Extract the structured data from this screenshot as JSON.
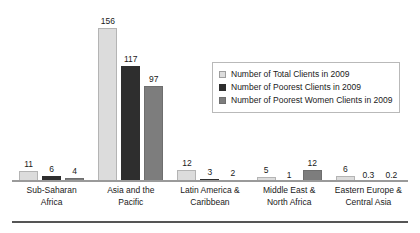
{
  "chart_data": {
    "type": "bar",
    "title": "",
    "subtitle": "",
    "xlabel": "",
    "ylabel": "",
    "ylim": [
      0,
      160
    ],
    "grid": false,
    "legend_position": "inside-right",
    "categories": [
      "Sub-Saharan Africa",
      "Asia and the Pacific",
      "Latin America & Caribbean",
      "Middle East & North Africa",
      "Eastern Europe & Central Asia"
    ],
    "category_lines": [
      [
        "Sub-Saharan",
        "Africa"
      ],
      [
        "Asia and the",
        "Pacific"
      ],
      [
        "Latin America &",
        "Caribbean"
      ],
      [
        "Middle East &",
        "North Africa"
      ],
      [
        "Eastern Europe &",
        "Central Asia"
      ]
    ],
    "series": [
      {
        "name": "Number of Total Clients in 2009",
        "color": "#dcdcdc",
        "values": [
          11,
          156,
          12,
          5,
          6
        ],
        "labels": [
          "11",
          "156",
          "12",
          "5",
          "6"
        ]
      },
      {
        "name": "Number of Poorest Clients in 2009",
        "color": "#2e2e2e",
        "values": [
          6,
          117,
          3,
          1,
          0.3
        ],
        "labels": [
          "6",
          "117",
          "3",
          "1",
          "0.3"
        ]
      },
      {
        "name": "Number of Poorest Women Clients in 2009",
        "color": "#7d7d7d",
        "values": [
          4,
          97,
          2,
          12,
          0.2
        ],
        "labels": [
          "4",
          "97",
          "2",
          "12",
          "0.2"
        ]
      }
    ]
  },
  "legend": {
    "items": [
      {
        "label": "Number of Total Clients in 2009",
        "swatch": "light-gray"
      },
      {
        "label": "Number of Poorest Clients in 2009",
        "swatch": "dark-gray"
      },
      {
        "label": "Number of Poorest Women Clients in 2009",
        "swatch": "medium-gray"
      }
    ]
  }
}
